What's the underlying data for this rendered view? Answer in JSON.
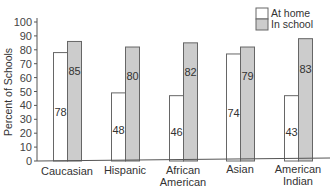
{
  "chart_data": {
    "type": "bar",
    "title": "",
    "xlabel": "",
    "ylabel": "Percent of Schools",
    "ylim": [
      0,
      100
    ],
    "yticks": [
      0,
      10,
      20,
      30,
      40,
      50,
      60,
      70,
      80,
      90,
      100
    ],
    "grid": false,
    "legend_position": "top-right",
    "categories": [
      "Caucasian",
      "Hispanic",
      "African American",
      "Asian",
      "American Indian"
    ],
    "category_lines": [
      [
        "Caucasian"
      ],
      [
        "Hispanic"
      ],
      [
        "African",
        "American"
      ],
      [
        "Asian"
      ],
      [
        "American",
        "Indian"
      ]
    ],
    "series": [
      {
        "name": "At home",
        "color": "#ffffff",
        "values": [
          78,
          48,
          46,
          74,
          43
        ]
      },
      {
        "name": "In school",
        "color": "#cccccc",
        "values": [
          85,
          80,
          82,
          79,
          83
        ]
      }
    ],
    "bar_heights_drawn": {
      "At home": [
        78,
        49,
        47,
        77,
        47
      ],
      "In school": [
        86,
        82,
        85,
        82,
        88
      ]
    }
  }
}
